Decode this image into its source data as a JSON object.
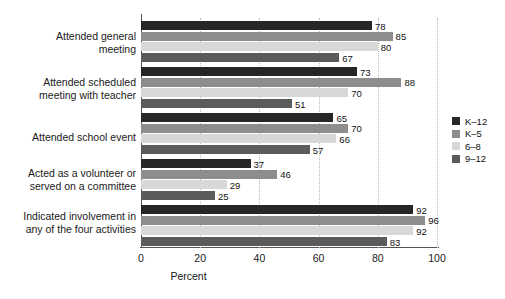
{
  "chart_data": {
    "type": "bar",
    "orientation": "horizontal",
    "title": "",
    "xlabel": "Percent",
    "ylabel": "",
    "xlim": [
      0,
      100
    ],
    "xticks": [
      0,
      20,
      40,
      60,
      80,
      100
    ],
    "grid": "vertical-dotted",
    "legend_position": "right",
    "categories": [
      "Attended general meeting",
      "Attended scheduled meeting with teacher",
      "Attended school event",
      "Acted as a volunteer or served on a committee",
      "Indicated involvement in any of the four activities"
    ],
    "category_lines": [
      [
        "Attended general",
        "meeting"
      ],
      [
        "Attended scheduled",
        "meeting with teacher"
      ],
      [
        "Attended school event"
      ],
      [
        "Acted as a volunteer or",
        "served on a committee"
      ],
      [
        "Indicated involvement in",
        "any of the four activities"
      ]
    ],
    "series": [
      {
        "name": "K-12",
        "color": "#262626",
        "values": [
          78,
          73,
          65,
          37,
          92
        ]
      },
      {
        "name": "K-5",
        "color": "#8d8d8d",
        "values": [
          85,
          88,
          70,
          46,
          96
        ]
      },
      {
        "name": "6-8",
        "color": "#d8d8d8",
        "values": [
          80,
          70,
          66,
          29,
          92
        ]
      },
      {
        "name": "9-12",
        "color": "#5b5b5b",
        "values": [
          67,
          51,
          57,
          25,
          83
        ]
      }
    ]
  },
  "axis": {
    "tick_labels": [
      "0",
      "20",
      "40",
      "60",
      "80",
      "100"
    ],
    "title": "Percent"
  },
  "legend": {
    "items": [
      {
        "label": "K–12",
        "color": "#262626"
      },
      {
        "label": "K–5",
        "color": "#8d8d8d"
      },
      {
        "label": "6–8",
        "color": "#d8d8d8"
      },
      {
        "label": "9–12",
        "color": "#5b5b5b"
      }
    ]
  },
  "footnote": {
    "text": ""
  }
}
